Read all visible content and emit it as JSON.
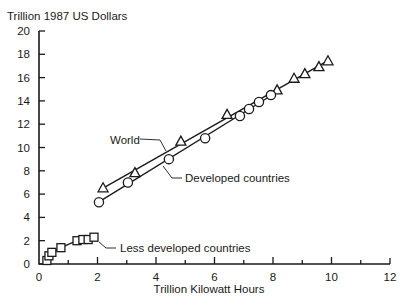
{
  "chart_data": {
    "type": "scatter",
    "title": "",
    "ylabel": "Trillion 1987 US Dollars",
    "xlabel": "Trillion Kilowatt Hours",
    "xlim": [
      0,
      12
    ],
    "ylim": [
      0,
      20
    ],
    "xticks": [
      0,
      2,
      4,
      6,
      8,
      10,
      12
    ],
    "xminor_ticks": [
      1,
      3,
      5,
      7,
      9,
      11
    ],
    "yticks": [
      0,
      2,
      4,
      6,
      8,
      10,
      12,
      14,
      16,
      18,
      20
    ],
    "grid": false,
    "legend": "inline labels with leader lines",
    "series": [
      {
        "name": "World",
        "marker": "triangle",
        "fit_line": true,
        "points": [
          [
            2.19,
            6.5
          ],
          [
            3.28,
            7.8
          ],
          [
            4.85,
            10.5
          ],
          [
            6.43,
            12.8
          ],
          [
            8.14,
            14.9
          ],
          [
            8.72,
            15.9
          ],
          [
            9.09,
            16.3
          ],
          [
            9.57,
            16.9
          ],
          [
            9.88,
            17.4
          ]
        ]
      },
      {
        "name": "Developed countries",
        "marker": "circle",
        "fit_line": true,
        "points": [
          [
            2.05,
            5.3
          ],
          [
            3.04,
            7.0
          ],
          [
            4.44,
            9.0
          ],
          [
            5.68,
            10.8
          ],
          [
            6.87,
            12.7
          ],
          [
            7.18,
            13.3
          ],
          [
            7.52,
            13.9
          ],
          [
            7.93,
            14.5
          ]
        ]
      },
      {
        "name": "Less developed countries",
        "marker": "square",
        "fit_line": true,
        "points": [
          [
            0.27,
            0.3
          ],
          [
            0.34,
            0.7
          ],
          [
            0.44,
            1.0
          ],
          [
            0.75,
            1.4
          ],
          [
            1.3,
            2.0
          ],
          [
            1.5,
            2.1
          ],
          [
            1.68,
            2.1
          ],
          [
            1.88,
            2.3
          ]
        ]
      }
    ],
    "annotations": [
      {
        "text": "World",
        "series": "World"
      },
      {
        "text": "Developed countries",
        "series": "Developed countries"
      },
      {
        "text": "Less developed countries",
        "series": "Less developed countries"
      }
    ]
  },
  "labels": {
    "y_axis_title": "Trillion 1987 US Dollars",
    "x_axis_title": "Trillion Kilowatt Hours",
    "world": "World",
    "developed": "Developed countries",
    "less_developed": "Less developed countries"
  },
  "colors": {
    "ink": "#1a1a1a",
    "background": "#ffffff"
  }
}
